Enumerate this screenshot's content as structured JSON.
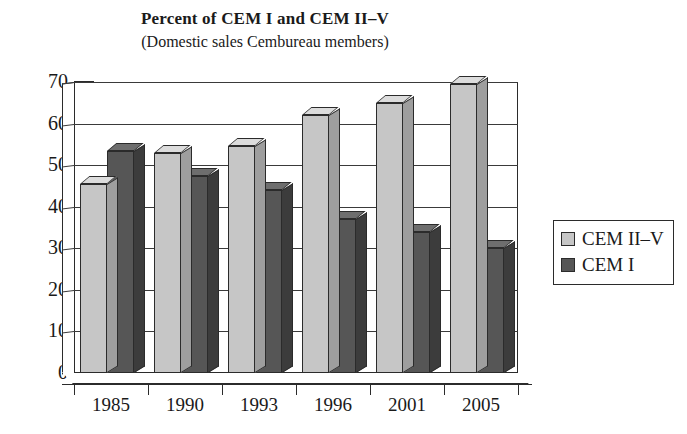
{
  "chart_data": {
    "type": "bar",
    "title": "Percent of CEM I and CEM II–V",
    "subtitle": "(Domestic sales Cembureau members)",
    "xlabel": "",
    "ylabel": "",
    "categories": [
      "1985",
      "1990",
      "1993",
      "1996",
      "2001",
      "2005"
    ],
    "series": [
      {
        "name": "CEM II–V",
        "color": "#c6c6c6",
        "values": [
          45.5,
          53,
          54.5,
          62,
          65,
          69.5
        ]
      },
      {
        "name": "CEM I",
        "color": "#565656",
        "values": [
          53.5,
          47.5,
          44,
          37,
          34,
          30
        ]
      }
    ],
    "ylim": [
      0,
      70
    ],
    "ytick_labels": [
      "0",
      "10",
      "20",
      "30",
      "40",
      "50",
      "60",
      "70"
    ],
    "ytick_values": [
      0,
      10,
      20,
      30,
      40,
      50,
      60,
      70
    ],
    "grid": true,
    "grid_axis": "y",
    "legend_position": "right",
    "style": "3d-column"
  },
  "legend": {
    "items": [
      {
        "label": "CEM II–V",
        "swatch": "light"
      },
      {
        "label": "CEM I",
        "swatch": "dark"
      }
    ]
  }
}
